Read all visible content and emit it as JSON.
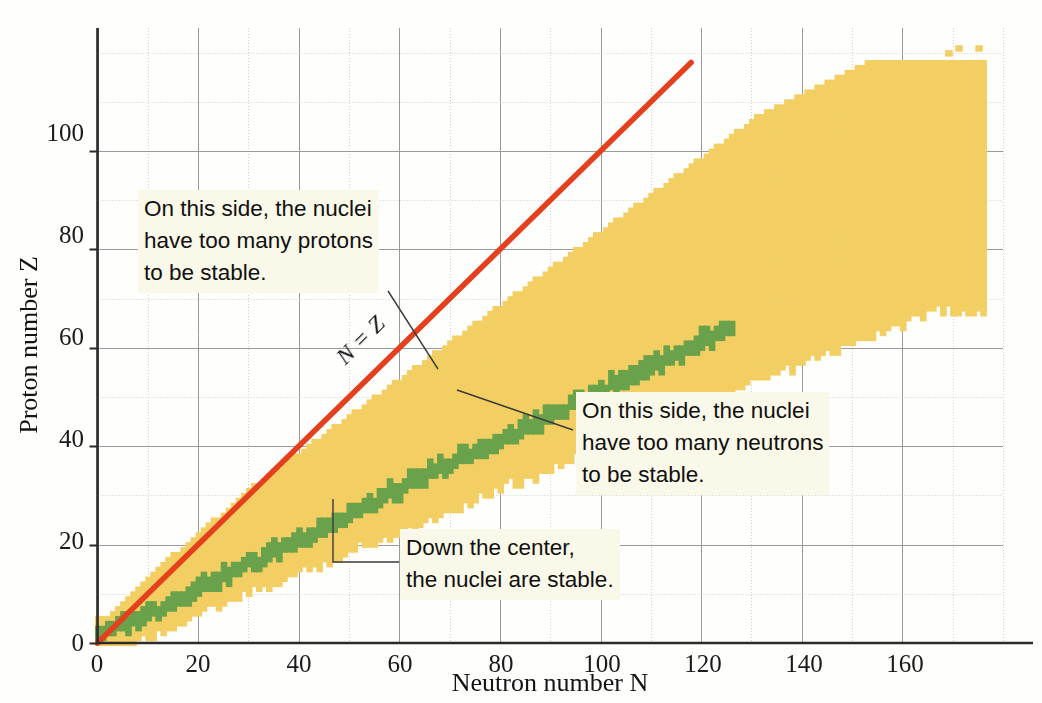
{
  "chart_data": {
    "type": "scatter",
    "title": "",
    "xlabel": "Neutron number N",
    "ylabel": "Proton number Z",
    "xlim": [
      0,
      180
    ],
    "ylim": [
      0,
      125
    ],
    "xticks": [
      0,
      20,
      40,
      60,
      80,
      100,
      120,
      140,
      160
    ],
    "yticks": [
      0,
      20,
      40,
      60,
      80,
      100
    ],
    "minor_tick_step": 10,
    "grid": true,
    "legend": "none",
    "series": [
      {
        "name": "stable nuclei",
        "color": "#6aa24c",
        "description": "Green squares forming the narrow central band of stable nuclides, running from N=0,Z=0 up to about N=126, Z=83."
      },
      {
        "name": "unstable (radioactive) nuclei",
        "color": "#f3cf63",
        "description": "Yellow squares forming the broad band of known radioactive nuclides surrounding the stable band, extending to about N=177, Z=118."
      }
    ],
    "annotations": [
      {
        "name": "n-equals-z-line",
        "text": "N = Z",
        "color": "#e5401e",
        "line_from": [
          0,
          0
        ],
        "line_to": [
          118,
          118
        ]
      },
      {
        "name": "too-many-protons",
        "text": "On this side, the nuclei have too many protons to be stable.",
        "points_to": [
          68,
          54
        ]
      },
      {
        "name": "too-many-neutrons",
        "text": "On this side, the nuclei have too many neutrons to be stable.",
        "points_to": [
          72,
          49
        ]
      },
      {
        "name": "down-the-center",
        "text": "Down the center, the nuclei are stable.",
        "points_to": [
          47,
          20
        ]
      }
    ],
    "band": {
      "note": "Band of known nuclides described as, for each neutron number N, the minimum and maximum proton number Z that are drawn, plus the stable-band Z range.",
      "n_values": [
        0,
        2,
        4,
        6,
        8,
        10,
        12,
        14,
        16,
        18,
        20,
        22,
        24,
        26,
        28,
        30,
        32,
        34,
        36,
        38,
        40,
        42,
        44,
        46,
        48,
        50,
        52,
        54,
        56,
        58,
        60,
        62,
        64,
        66,
        68,
        70,
        72,
        74,
        76,
        78,
        80,
        82,
        84,
        86,
        88,
        90,
        92,
        94,
        96,
        98,
        100,
        102,
        104,
        106,
        108,
        110,
        112,
        114,
        116,
        118,
        120,
        122,
        124,
        126,
        128,
        130,
        132,
        134,
        136,
        138,
        140,
        142,
        144,
        146,
        148,
        150,
        152,
        154,
        156,
        158,
        160,
        162,
        164,
        166,
        168,
        170,
        172,
        174,
        176
      ],
      "z_min": [
        1,
        1,
        2,
        3,
        4,
        5,
        6,
        7,
        8,
        9,
        10,
        12,
        13,
        15,
        16,
        18,
        19,
        21,
        22,
        24,
        25,
        27,
        28,
        30,
        31,
        33,
        34,
        36,
        37,
        39,
        40,
        42,
        43,
        45,
        46,
        48,
        49,
        51,
        52,
        54,
        55,
        57,
        58,
        60,
        61,
        63,
        64,
        66,
        67,
        69,
        70,
        72,
        73,
        75,
        76,
        78,
        79,
        81,
        82,
        84,
        85,
        87,
        88,
        90,
        91,
        93,
        94,
        95,
        96,
        97,
        98,
        99,
        100,
        101,
        102,
        103,
        104,
        105,
        106,
        107,
        108,
        109,
        110,
        111,
        112,
        113,
        114,
        115,
        116
      ],
      "z_max": [
        3,
        5,
        7,
        9,
        11,
        13,
        15,
        17,
        18,
        20,
        22,
        24,
        25,
        27,
        29,
        31,
        32,
        34,
        35,
        37,
        38,
        40,
        41,
        43,
        44,
        46,
        47,
        49,
        50,
        52,
        53,
        55,
        56,
        58,
        59,
        61,
        62,
        64,
        65,
        67,
        68,
        70,
        71,
        73,
        74,
        76,
        77,
        79,
        80,
        82,
        83,
        85,
        86,
        88,
        89,
        91,
        92,
        94,
        95,
        97,
        98,
        100,
        101,
        103,
        104,
        106,
        107,
        108,
        109,
        110,
        111,
        112,
        113,
        114,
        115,
        116,
        117,
        118,
        118,
        118,
        118,
        118,
        118,
        118,
        118,
        118,
        118,
        118,
        118
      ],
      "stable_z_low": [
        1,
        1,
        2,
        3,
        4,
        5,
        6,
        7,
        8,
        9,
        10,
        11,
        12,
        13,
        14,
        15,
        16,
        17,
        18,
        19,
        20,
        21,
        22,
        23,
        24,
        25,
        26,
        27,
        28,
        29,
        30,
        31,
        32,
        33,
        34,
        35,
        36,
        37,
        38,
        39,
        40,
        41,
        42,
        43,
        44,
        45,
        46,
        47,
        48,
        49,
        50,
        51,
        52,
        53,
        54,
        55,
        56,
        57,
        58,
        59,
        60,
        61,
        62,
        63,
        64,
        65,
        66,
        67,
        68,
        69,
        70,
        71,
        72,
        73,
        74,
        75,
        76,
        77,
        78,
        79,
        80,
        81,
        82,
        83,
        83,
        83,
        83,
        83,
        83
      ],
      "stable_z_high": [
        2,
        3,
        4,
        5,
        6,
        7,
        8,
        9,
        10,
        11,
        12,
        13,
        14,
        15,
        16,
        17,
        18,
        19,
        20,
        21,
        22,
        23,
        24,
        25,
        26,
        27,
        28,
        29,
        30,
        31,
        32,
        33,
        34,
        35,
        36,
        37,
        38,
        39,
        40,
        41,
        42,
        43,
        44,
        45,
        46,
        47,
        48,
        49,
        50,
        51,
        52,
        53,
        54,
        55,
        56,
        57,
        58,
        59,
        60,
        61,
        62,
        63,
        64,
        65,
        66,
        67,
        68,
        69,
        70,
        71,
        72,
        73,
        74,
        75,
        76,
        77,
        78,
        79,
        80,
        81,
        82,
        83,
        83,
        83,
        83,
        83,
        83,
        83,
        83
      ]
    },
    "superheavy_markers": [
      [
        153,
        112
      ],
      [
        155,
        113
      ],
      [
        158,
        115
      ],
      [
        162,
        117
      ],
      [
        165,
        118
      ],
      [
        169,
        120
      ],
      [
        171,
        121
      ],
      [
        175,
        121
      ],
      [
        148,
        110
      ],
      [
        151,
        110
      ]
    ]
  },
  "axes": {
    "x_title": "Neutron number N",
    "y_title": "Proton number Z",
    "x_ticks": [
      "0",
      "20",
      "40",
      "60",
      "80",
      "100",
      "120",
      "140",
      "160"
    ],
    "y_ticks": [
      "0",
      "20",
      "40",
      "60",
      "80",
      "100"
    ]
  },
  "annotations": {
    "nz_line_label": "N = Z",
    "protons": {
      "line1": "On this side, the nuclei",
      "line2": "have too many protons",
      "line3": "to be stable."
    },
    "neutrons": {
      "line1": "On this side, the nuclei",
      "line2": "have too many neutrons",
      "line3": "to be stable."
    },
    "stable": {
      "line1": "Down the center,",
      "line2": "the nuclei are stable."
    }
  },
  "colors": {
    "stable": "#6aa24c",
    "unstable": "#f3cf63",
    "nz_line": "#e5401e",
    "axis": "#2b2b2b",
    "grid_major": "#9a9a9a",
    "grid_minor": "#cfcfcf",
    "callout_bg": "#faf8e8",
    "leader": "#3a3a3a"
  }
}
